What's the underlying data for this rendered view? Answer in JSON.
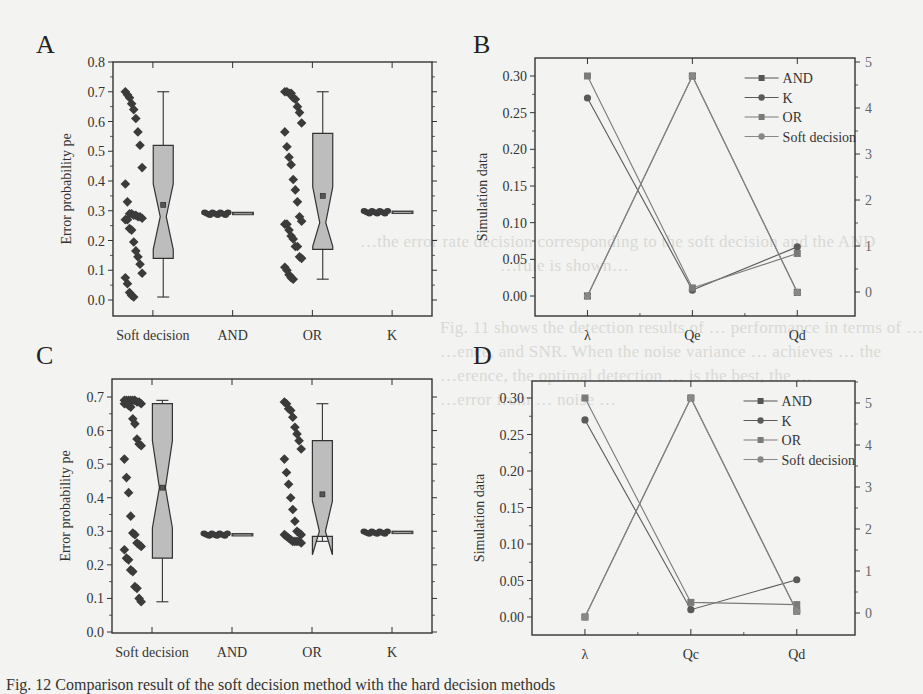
{
  "figure": {
    "panels": [
      "A",
      "B",
      "C",
      "D"
    ],
    "caption_fragment": "Fig. 12   Comparison result of the soft decision method with the hard decision methods"
  },
  "background_text": [
    "…the error rate decision corresponding to the soft decision and the AND",
    "…rule is shown…",
    "Fig. 11 shows the detection results of … performance in terms of …",
    "…ence, and SNR. When the noise variance … achieves … the",
    "…erence, the optimal detection … is the best, the …",
    "…error from … noise …"
  ],
  "chart_data": [
    {
      "panel": "A",
      "type": "box",
      "title": "",
      "xlabel": "",
      "ylabel": "Error probability pe",
      "ylim": [
        0.0,
        0.8
      ],
      "yticks": [
        "0.0",
        "0.1",
        "0.2",
        "0.3",
        "0.4",
        "0.5",
        "0.6",
        "0.7",
        "0.8"
      ],
      "categories": [
        "Soft decision",
        "AND",
        "OR",
        "K"
      ],
      "boxes": [
        {
          "name": "Soft decision",
          "min": 0.01,
          "q1": 0.14,
          "median": 0.28,
          "q3": 0.52,
          "max": 0.7,
          "mean": 0.32,
          "notch_lo": 0.17,
          "notch_hi": 0.39
        },
        {
          "name": "AND",
          "min": 0.289,
          "q1": 0.289,
          "median": 0.29,
          "q3": 0.291,
          "max": 0.292,
          "mean": 0.29
        },
        {
          "name": "OR",
          "min": 0.07,
          "q1": 0.17,
          "median": 0.26,
          "q3": 0.56,
          "max": 0.7,
          "mean": 0.35,
          "notch_lo": 0.18,
          "notch_hi": 0.38
        },
        {
          "name": "K",
          "min": 0.293,
          "q1": 0.293,
          "median": 0.294,
          "q3": 0.295,
          "max": 0.296,
          "mean": 0.294
        }
      ],
      "scatter": {
        "Soft decision": [
          0.7,
          0.69,
          0.68,
          0.66,
          0.64,
          0.61,
          0.565,
          0.52,
          0.445,
          0.39,
          0.33,
          0.29,
          0.29,
          0.285,
          0.285,
          0.28,
          0.28,
          0.275,
          0.27,
          0.27,
          0.24,
          0.235,
          0.195,
          0.165,
          0.145,
          0.12,
          0.09,
          0.075,
          0.055,
          0.025,
          0.015,
          0.01
        ],
        "AND": [
          0.29,
          0.29,
          0.29,
          0.29,
          0.29,
          0.29,
          0.29,
          0.29,
          0.29,
          0.29
        ],
        "OR": [
          0.7,
          0.7,
          0.695,
          0.695,
          0.68,
          0.675,
          0.65,
          0.63,
          0.595,
          0.565,
          0.515,
          0.48,
          0.455,
          0.405,
          0.37,
          0.33,
          0.28,
          0.265,
          0.255,
          0.255,
          0.235,
          0.215,
          0.205,
          0.18,
          0.18,
          0.145,
          0.14,
          0.11,
          0.1,
          0.085,
          0.075,
          0.07
        ],
        "K": [
          0.295,
          0.295,
          0.295,
          0.295,
          0.295,
          0.295,
          0.295,
          0.295,
          0.295,
          0.295
        ]
      }
    },
    {
      "panel": "B",
      "type": "line",
      "title": "",
      "xlabel": "",
      "ylabel": "Simulation data",
      "categories": [
        "λ",
        "Qe",
        "Qd"
      ],
      "ylim": [
        -0.01,
        0.32
      ],
      "yticks": [
        "0.00",
        "0.05",
        "0.10",
        "0.15",
        "0.20",
        "0.25",
        "0.30"
      ],
      "y2lim": [
        -0.5,
        5
      ],
      "y2ticks": [
        "0",
        "1",
        "2",
        "3",
        "4",
        "5"
      ],
      "legend_position": "upper right",
      "series": [
        {
          "name": "AND",
          "marker": "square",
          "values": [
            0.0,
            0.3,
            0.005
          ]
        },
        {
          "name": "K",
          "marker": "circle",
          "values": [
            0.27,
            0.008,
            0.067
          ]
        },
        {
          "name": "OR",
          "marker": "square",
          "values": [
            0.3,
            0.011,
            0.058
          ]
        },
        {
          "name": "Soft decision",
          "marker": "circle",
          "values": [
            0.0,
            0.3,
            0.005
          ]
        }
      ]
    },
    {
      "panel": "C",
      "type": "box",
      "title": "",
      "xlabel": "",
      "ylabel": "Error probability pe",
      "ylim": [
        0.0,
        0.75
      ],
      "yticks": [
        "0.0",
        "0.1",
        "0.2",
        "0.3",
        "0.4",
        "0.5",
        "0.6",
        "0.7"
      ],
      "categories": [
        "Soft decision",
        "AND",
        "OR",
        "K"
      ],
      "boxes": [
        {
          "name": "Soft decision",
          "min": 0.09,
          "q1": 0.22,
          "median": 0.43,
          "q3": 0.68,
          "max": 0.69,
          "mean": 0.43,
          "notch_lo": 0.31,
          "notch_hi": 0.57
        },
        {
          "name": "AND",
          "min": 0.288,
          "q1": 0.288,
          "median": 0.289,
          "q3": 0.29,
          "max": 0.292,
          "mean": 0.289
        },
        {
          "name": "OR",
          "min": 0.27,
          "q1": 0.285,
          "median": 0.3,
          "q3": 0.57,
          "max": 0.68,
          "mean": 0.41,
          "notch_lo": 0.23,
          "notch_hi": 0.39
        },
        {
          "name": "K",
          "min": 0.295,
          "q1": 0.295,
          "median": 0.296,
          "q3": 0.297,
          "max": 0.298,
          "mean": 0.296
        }
      ],
      "scatter": {
        "Soft decision": [
          0.69,
          0.69,
          0.69,
          0.69,
          0.69,
          0.69,
          0.685,
          0.685,
          0.68,
          0.68,
          0.68,
          0.675,
          0.67,
          0.635,
          0.62,
          0.575,
          0.56,
          0.555,
          0.515,
          0.46,
          0.415,
          0.345,
          0.295,
          0.29,
          0.265,
          0.26,
          0.255,
          0.245,
          0.22,
          0.215,
          0.185,
          0.18,
          0.135,
          0.13,
          0.1,
          0.09
        ],
        "AND": [
          0.29,
          0.29,
          0.29,
          0.29,
          0.29,
          0.29,
          0.29,
          0.29,
          0.29,
          0.29
        ],
        "OR": [
          0.685,
          0.68,
          0.665,
          0.66,
          0.64,
          0.61,
          0.59,
          0.57,
          0.545,
          0.515,
          0.475,
          0.44,
          0.4,
          0.365,
          0.33,
          0.3,
          0.295,
          0.29,
          0.29,
          0.285,
          0.28,
          0.275,
          0.27,
          0.27,
          0.27,
          0.27,
          0.265
        ],
        "K": [
          0.296,
          0.296,
          0.296,
          0.296,
          0.296,
          0.296,
          0.296,
          0.296,
          0.296,
          0.296
        ]
      }
    },
    {
      "panel": "D",
      "type": "line",
      "title": "",
      "xlabel": "",
      "ylabel": "Simulation data",
      "categories": [
        "λ",
        "Qc",
        "Qd"
      ],
      "ylim": [
        -0.01,
        0.32
      ],
      "yticks": [
        "0.00",
        "0.05",
        "0.10",
        "0.15",
        "0.20",
        "0.25",
        "0.30"
      ],
      "y2lim": [
        -0.5,
        5.5
      ],
      "y2ticks": [
        "0",
        "1",
        "2",
        "3",
        "4",
        "5"
      ],
      "legend_position": "upper right",
      "series": [
        {
          "name": "AND",
          "marker": "square",
          "values": [
            0.0,
            0.3,
            0.008
          ]
        },
        {
          "name": "K",
          "marker": "circle",
          "values": [
            0.27,
            0.01,
            0.051
          ]
        },
        {
          "name": "OR",
          "marker": "square",
          "values": [
            0.3,
            0.02,
            0.017
          ]
        },
        {
          "name": "Soft decision",
          "marker": "circle",
          "values": [
            0.0,
            0.3,
            0.008
          ]
        }
      ]
    }
  ]
}
